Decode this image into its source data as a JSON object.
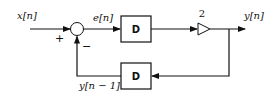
{
  "diagram": {
    "type": "block-diagram",
    "input": {
      "label": "x[n]"
    },
    "summing_junction": {
      "plus_sign": "+",
      "minus_sign": "−"
    },
    "error_signal": {
      "label": "e[n]"
    },
    "forward_delay": {
      "label": "D"
    },
    "gain": {
      "label": "2"
    },
    "output": {
      "label": "y[n]"
    },
    "feedback_delay": {
      "label": "D"
    },
    "feedback_signal": {
      "label": "y[n − 1]"
    },
    "colors": {
      "line": "#111111",
      "background": "#ffffff"
    }
  }
}
